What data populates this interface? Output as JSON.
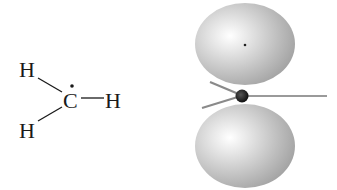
{
  "structural_formula": {
    "atoms": {
      "h_top_left": "H",
      "h_bottom_left": "H",
      "carbon": "C",
      "h_right": "H"
    },
    "radical_dot": "•"
  },
  "orbital_model": {
    "lobes": [
      "top-p-lobe",
      "bottom-p-lobe"
    ],
    "bonds": 3,
    "colors": {
      "lobe_light": "#ffffff",
      "lobe_mid": "#c8c8c8",
      "lobe_dark": "#9a9a9a",
      "bond": "#8a8a8a",
      "nucleus": "#111111"
    }
  }
}
